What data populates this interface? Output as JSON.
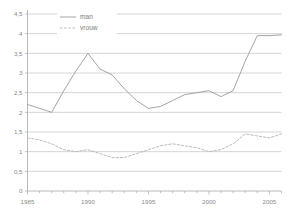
{
  "chart_data": {
    "type": "line",
    "title": "",
    "subtitle": "",
    "xlabel": "",
    "ylabel": "",
    "xlim": [
      1985,
      2006
    ],
    "ylim": [
      0,
      4.5
    ],
    "grid": true,
    "grid_axis": "y",
    "legend_position": "top-left",
    "x": [
      1985,
      1986,
      1987,
      1988,
      1989,
      1990,
      1991,
      1992,
      1993,
      1994,
      1995,
      1996,
      1997,
      1998,
      1999,
      2000,
      2001,
      2002,
      2003,
      2004,
      2005,
      2006
    ],
    "x_tick_labels": [
      "1985",
      "1990",
      "1995",
      "2000",
      "2005"
    ],
    "x_tick_values": [
      1985,
      1990,
      1995,
      2000,
      2005
    ],
    "y_tick_labels": [
      "0",
      "0,5",
      "1",
      "1,5",
      "2",
      "2,5",
      "3",
      "3,5",
      "4",
      "4,5"
    ],
    "y_tick_values": [
      0,
      0.5,
      1,
      1.5,
      2,
      2.5,
      3,
      3.5,
      4,
      4.5
    ],
    "series": [
      {
        "name": "man",
        "style": "solid",
        "color": "#9a9a9a",
        "values": [
          2.2,
          2.1,
          2.0,
          2.55,
          3.05,
          3.5,
          3.1,
          2.95,
          2.6,
          2.3,
          2.1,
          2.15,
          2.3,
          2.45,
          2.5,
          2.55,
          2.4,
          2.55,
          3.3,
          3.95,
          3.95,
          3.97
        ]
      },
      {
        "name": "vrouw",
        "style": "dashed",
        "color": "#b3b3b3",
        "values": [
          1.35,
          1.3,
          1.2,
          1.05,
          1.0,
          1.05,
          0.95,
          0.85,
          0.85,
          0.95,
          1.05,
          1.15,
          1.2,
          1.15,
          1.1,
          1.0,
          1.05,
          1.2,
          1.45,
          1.4,
          1.35,
          1.45
        ]
      }
    ]
  },
  "legend": {
    "items": [
      {
        "label": "man",
        "style": "solid"
      },
      {
        "label": "vrouw",
        "style": "dashed"
      }
    ]
  },
  "colors": {
    "axis": "#a8a8a8",
    "grid": "#b8b8b8",
    "text": "#8a8a8a",
    "series_man": "#9a9a9a",
    "series_vrouw": "#b3b3b3",
    "background": "#ffffff"
  }
}
